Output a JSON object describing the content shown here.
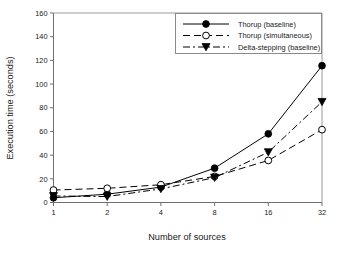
{
  "chart_data": {
    "type": "line",
    "title": "",
    "xlabel": "Number of sources",
    "ylabel": "Execution time (seconds)",
    "x": [
      1,
      2,
      4,
      8,
      16,
      32
    ],
    "xtick_labels": [
      "1",
      "2",
      "4",
      "8",
      "16",
      "32"
    ],
    "ytick_labels": [
      "0",
      "20",
      "40",
      "60",
      "80",
      "100",
      "120",
      "140",
      "160"
    ],
    "yticks": [
      0,
      20,
      40,
      60,
      80,
      100,
      120,
      140,
      160
    ],
    "ylim": [
      0,
      160
    ],
    "xlim": [
      1,
      32
    ],
    "xscale": "log2",
    "grid": false,
    "legend_position": "top-right",
    "series": [
      {
        "name": "Thorup (baseline)",
        "marker": "filled-circle",
        "linestyle": "solid",
        "values": [
          4,
          7,
          13,
          29,
          58,
          115.5
        ]
      },
      {
        "name": "Thorup (simultaneous)",
        "marker": "open-circle",
        "linestyle": "dashed",
        "values": [
          10.5,
          12,
          15,
          22,
          35.5,
          61.5
        ]
      },
      {
        "name": "Delta-stepping (baseline)",
        "marker": "filled-triangle-down",
        "linestyle": "dash-dot",
        "values": [
          5.5,
          5,
          11.5,
          21,
          42.5,
          85
        ]
      }
    ]
  },
  "axes": {
    "x_title": "Number of sources",
    "y_title": "Execution time (seconds)"
  },
  "legend": {
    "entries": [
      {
        "label": "Thorup (baseline)"
      },
      {
        "label": "Thorup (simultaneous)"
      },
      {
        "label": "Delta-stepping (baseline)"
      }
    ]
  },
  "colors": {
    "ink": "#000000",
    "axis": "#6f6f6f",
    "legend_border": "#8a8a8a",
    "background": "#ffffff"
  }
}
